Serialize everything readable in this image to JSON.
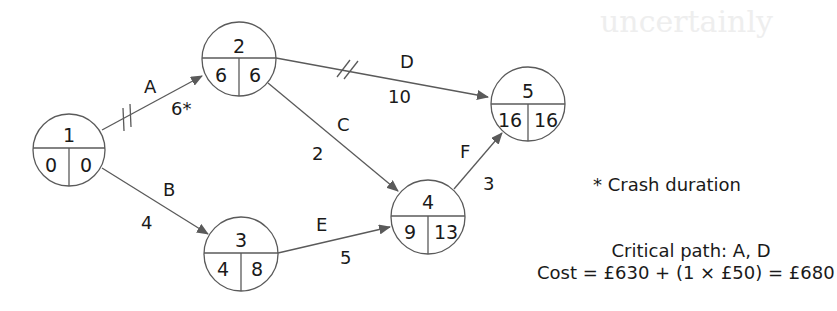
{
  "diagram": {
    "type": "activity-on-arrow network",
    "nodes": [
      {
        "id": "1",
        "earliest": "0",
        "latest": "0"
      },
      {
        "id": "2",
        "earliest": "6",
        "latest": "6"
      },
      {
        "id": "3",
        "earliest": "4",
        "latest": "8"
      },
      {
        "id": "4",
        "earliest": "9",
        "latest": "13"
      },
      {
        "id": "5",
        "earliest": "16",
        "latest": "16"
      }
    ],
    "edges": [
      {
        "activity": "A",
        "from": "1",
        "to": "2",
        "duration": "6*",
        "critical": true
      },
      {
        "activity": "B",
        "from": "1",
        "to": "3",
        "duration": "4",
        "critical": false
      },
      {
        "activity": "C",
        "from": "2",
        "to": "4",
        "duration": "2",
        "critical": false
      },
      {
        "activity": "D",
        "from": "2",
        "to": "5",
        "duration": "10",
        "critical": true
      },
      {
        "activity": "E",
        "from": "3",
        "to": "4",
        "duration": "5",
        "critical": false
      },
      {
        "activity": "F",
        "from": "4",
        "to": "5",
        "duration": "3",
        "critical": false
      }
    ],
    "notes": {
      "crash_note": "* Crash duration",
      "critical_path": "Critical path: A, D",
      "cost": "Cost = £630 + (1 × £50) = £680"
    },
    "colors": {
      "line": "#5a5a5a",
      "text": "#1a1a1a",
      "background": "#ffffff"
    }
  },
  "background_bleed": {
    "title": "uncertainly"
  }
}
